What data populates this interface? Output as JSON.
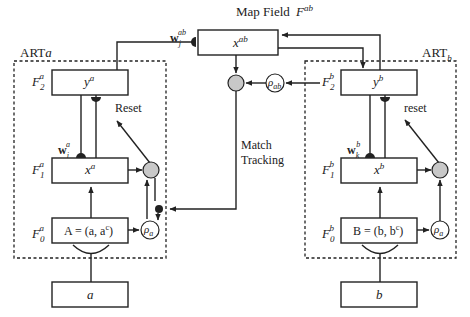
{
  "diagram": {
    "map_field": {
      "label": "Map Field",
      "field": "F",
      "field_sup": "ab",
      "box": "x",
      "box_sup": "ab",
      "weight": "w",
      "weight_sub": "j",
      "weight_sup": "ab"
    },
    "art_a": {
      "title": "ART",
      "title_sub": "a",
      "f2": {
        "label": "F",
        "sub": "2",
        "sup": "a",
        "box": "y",
        "box_sup": "a"
      },
      "f1": {
        "label": "F",
        "sub": "1",
        "sup": "a",
        "box": "x",
        "box_sup": "a"
      },
      "f0": {
        "label": "F",
        "sub": "0",
        "sup": "a",
        "box": "A = (a, a",
        "box_sup": "c",
        "box_end": ")"
      },
      "weight": {
        "label": "w",
        "sub": "j",
        "sup": "a"
      },
      "reset": "Reset",
      "rho": {
        "label": "ρ",
        "sub": "a"
      },
      "input": "a"
    },
    "art_b": {
      "title": "ART",
      "title_sub": "b",
      "f2": {
        "label": "F",
        "sub": "2",
        "sup": "b",
        "box": "y",
        "box_sup": "b"
      },
      "f1": {
        "label": "F",
        "sub": "1",
        "sup": "b",
        "box": "x",
        "box_sup": "b"
      },
      "f0": {
        "label": "F",
        "sub": "0",
        "sup": "b",
        "box": "B = (b, b",
        "box_sup": "c",
        "box_end": ")"
      },
      "weight": {
        "label": "w",
        "sub": "k",
        "sup": "b"
      },
      "reset": "reset",
      "rho": {
        "label": "ρ",
        "sub": "a"
      },
      "input": "b"
    },
    "rho_ab": {
      "label": "ρ",
      "sub": "ab"
    },
    "match_tracking": [
      "Match",
      "Tracking"
    ]
  }
}
